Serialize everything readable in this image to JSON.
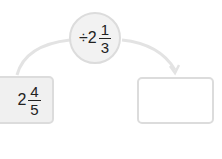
{
  "operation": {
    "operator": "÷",
    "whole": "2",
    "numerator": "1",
    "denominator": "3"
  },
  "input": {
    "whole": "2",
    "numerator": "4",
    "denominator": "5"
  },
  "output": {
    "value": ""
  },
  "colors": {
    "arc": "#e3e3e3",
    "border": "#dcdcdc",
    "input_fill": "#f0f0f0",
    "circle_fill": "#f2f2f2"
  }
}
